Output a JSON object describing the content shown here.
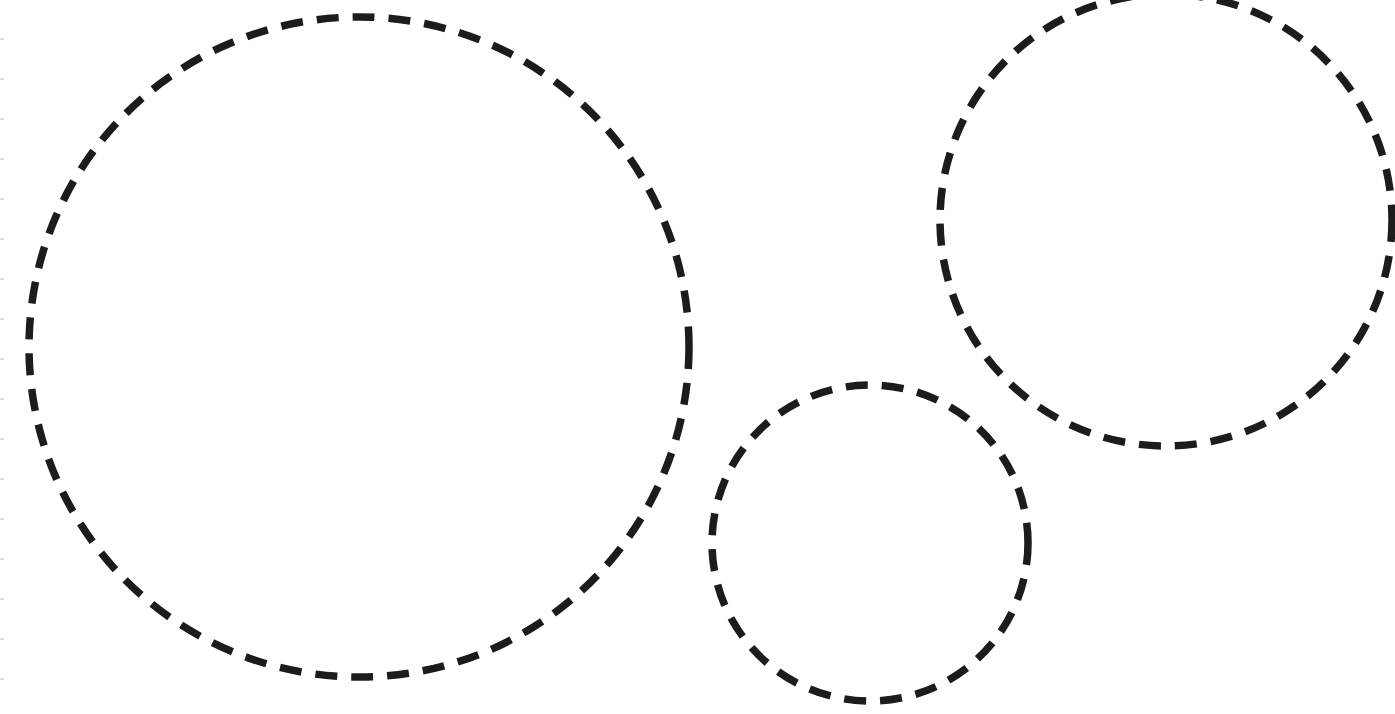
{
  "page": {
    "width": 1395,
    "height": 714,
    "background": "#ffffff"
  },
  "stroke": {
    "color": "#1c1c1c",
    "width": 7.5,
    "dash": 22,
    "gap": 14
  },
  "circles": [
    {
      "name": "large-dashed-circle",
      "cx": 359,
      "cy": 347,
      "r": 330
    },
    {
      "name": "small-dashed-circle",
      "cx": 870,
      "cy": 543,
      "r": 158
    },
    {
      "name": "top-right-dashed-circle",
      "cx": 1166,
      "cy": 220,
      "r": 226
    }
  ]
}
